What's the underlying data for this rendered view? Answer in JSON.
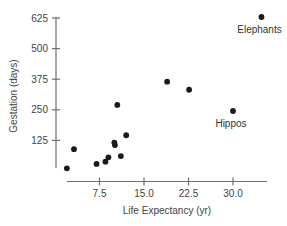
{
  "chart_data": {
    "type": "scatter",
    "title": "",
    "xlabel": "Life Expectancy (yr)",
    "ylabel": "Gestation (days)",
    "xlim": [
      0,
      36
    ],
    "ylim": [
      0,
      640
    ],
    "x_ticks": [
      7.5,
      15.0,
      22.5,
      30.0
    ],
    "x_tick_labels": [
      "7.5",
      "15.0",
      "22.5",
      "30.0"
    ],
    "y_ticks": [
      125,
      250,
      375,
      500,
      625
    ],
    "y_tick_labels": [
      "125",
      "250",
      "375",
      "500",
      "625"
    ],
    "grid": false,
    "legend": null,
    "series": [
      {
        "name": "Animals",
        "points": [
          {
            "x": 2,
            "y": 11
          },
          {
            "x": 3.2,
            "y": 89
          },
          {
            "x": 7,
            "y": 29
          },
          {
            "x": 8.5,
            "y": 38
          },
          {
            "x": 9,
            "y": 56
          },
          {
            "x": 10,
            "y": 116
          },
          {
            "x": 10.1,
            "y": 106
          },
          {
            "x": 10.5,
            "y": 270
          },
          {
            "x": 11.1,
            "y": 61
          },
          {
            "x": 12,
            "y": 146
          },
          {
            "x": 18.9,
            "y": 365
          },
          {
            "x": 22.6,
            "y": 332
          },
          {
            "x": 30,
            "y": 245,
            "label": "Hippos"
          },
          {
            "x": 34.8,
            "y": 629,
            "label": "Elephants"
          }
        ]
      }
    ],
    "annotations": [
      {
        "text": "Elephants",
        "x": 34.8,
        "y": 629
      },
      {
        "text": "Hippos",
        "x": 30,
        "y": 245
      }
    ]
  }
}
